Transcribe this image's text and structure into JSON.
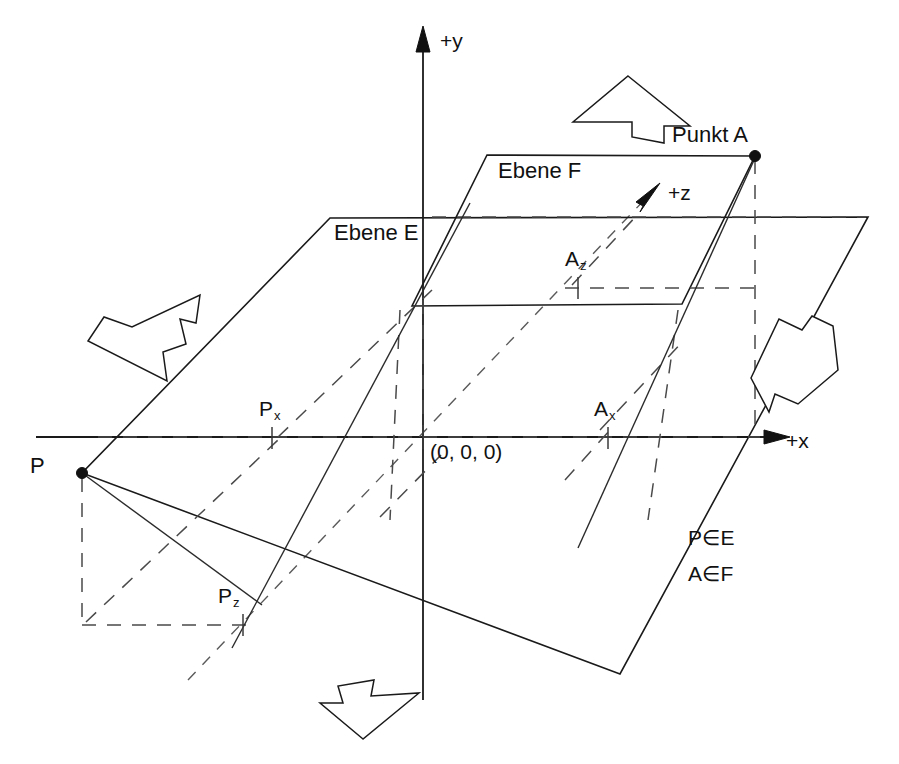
{
  "figure": {
    "background_color": "#ffffff",
    "line_color": "#1a1a1a",
    "dashed_color": "#4a4a4a"
  },
  "axes": {
    "x_label": "+x",
    "y_label": "+y",
    "z_label": "+z",
    "origin_label": "(0, 0, 0)"
  },
  "planes": [
    {
      "id": "E",
      "label": "Ebene E",
      "note": "untere Ebene, enthaelt Punkt P"
    },
    {
      "id": "F",
      "label": "Ebene F",
      "note": "obere Ebene, enthaelt Punkt A"
    }
  ],
  "points": [
    {
      "id": "A",
      "label": "Punkt A",
      "marker": true
    },
    {
      "id": "P",
      "label": "P",
      "marker": true
    }
  ],
  "projections": [
    {
      "id": "Az",
      "base": "A",
      "sub": "z"
    },
    {
      "id": "Ax",
      "base": "A",
      "sub": "x"
    },
    {
      "id": "Px",
      "base": "P",
      "sub": "x"
    },
    {
      "id": "Pz",
      "base": "P",
      "sub": "z"
    }
  ],
  "relations": [
    {
      "text": "P∈E"
    },
    {
      "text": "A∈F"
    }
  ],
  "normal_arrows": [
    {
      "id": "top",
      "direction": "up",
      "semantic": "plane-normal-arrow-top"
    },
    {
      "id": "left",
      "direction": "upper-right",
      "semantic": "plane-normal-arrow-left"
    },
    {
      "id": "right",
      "direction": "lower-left",
      "semantic": "plane-normal-arrow-right"
    },
    {
      "id": "bottom",
      "direction": "down",
      "semantic": "plane-normal-arrow-bottom"
    }
  ]
}
